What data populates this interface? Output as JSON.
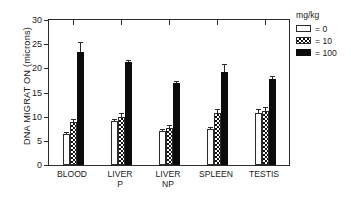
{
  "chart_data": {
    "type": "bar",
    "title": "",
    "xlabel": "",
    "ylabel": "DNA MIGRAT ON (microns)",
    "ylim": [
      0,
      30
    ],
    "yticks": [
      0,
      5,
      10,
      15,
      20,
      25,
      30
    ],
    "grid": false,
    "legend_position": "right",
    "legend_title": "mg/kg",
    "categories": [
      "BLOOD",
      "LIVER\nP",
      "LIVER\nNP",
      "SPLEEN",
      "TESTIS"
    ],
    "series": [
      {
        "name": "= 0",
        "fill": "white",
        "values": [
          6.5,
          9.1,
          7.0,
          7.4,
          10.8
        ],
        "errors": [
          0.3,
          0.5,
          0.5,
          0.4,
          0.7
        ]
      },
      {
        "name": "= 10",
        "fill": "checkered",
        "values": [
          8.8,
          9.9,
          7.6,
          10.8,
          11.1
        ],
        "errors": [
          0.8,
          0.9,
          0.7,
          0.8,
          0.8
        ]
      },
      {
        "name": "= 100",
        "fill": "black",
        "values": [
          23.4,
          21.4,
          16.9,
          19.2,
          17.7
        ],
        "errors": [
          2.0,
          0.3,
          0.5,
          1.6,
          0.8
        ]
      }
    ]
  },
  "legend": {
    "title": "mg/kg",
    "entries": [
      {
        "label": "= 0",
        "fill": "white"
      },
      {
        "label": "= 10",
        "fill": "checkered"
      },
      {
        "label": "= 100",
        "fill": "black"
      }
    ]
  },
  "axes": {
    "y_title": "DNA MIGRAT ON (microns)",
    "y_tick_labels": [
      "0",
      "5",
      "10",
      "15",
      "20",
      "25",
      "30"
    ],
    "x_tick_labels": [
      "BLOOD",
      "LIVER\nP",
      "LIVER\nNP",
      "SPLEEN",
      "TESTIS"
    ]
  },
  "colors": {
    "axis": "#2b2b2b",
    "series_0": "#ffffff",
    "series_1": "#111111",
    "series_2": "#0b0b0b",
    "text": "#1a1a1a",
    "background": "#ffffff"
  }
}
